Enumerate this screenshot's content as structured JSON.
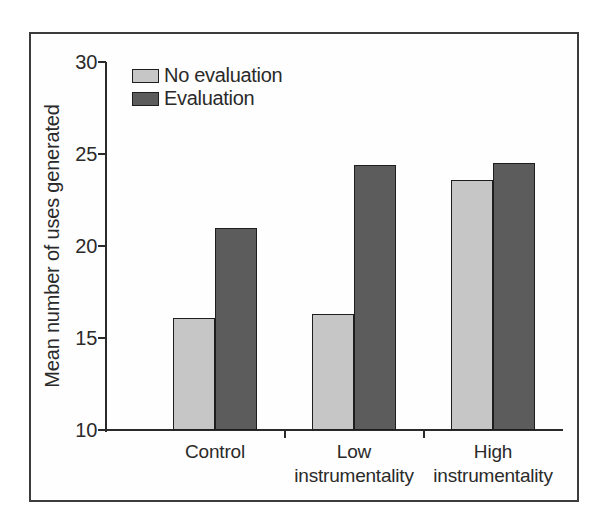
{
  "chart_data": {
    "type": "bar",
    "title": "",
    "ylabel": "Mean number of uses generated",
    "xlabel": "",
    "ylim": [
      10,
      30
    ],
    "yticks": [
      10,
      15,
      20,
      25,
      30
    ],
    "categories": [
      "Control",
      "Low instrumentality",
      "High instrumentality"
    ],
    "series": [
      {
        "name": "No evaluation",
        "color": "#c6c6c6",
        "values": [
          16.1,
          16.3,
          23.6
        ]
      },
      {
        "name": "Evaluation",
        "color": "#5c5c5c",
        "values": [
          21.0,
          24.4,
          24.5
        ]
      }
    ],
    "legend_position": "top-left",
    "grid": false
  },
  "figure": {
    "frame_border_color": "#3c3c3c",
    "background": "#ffffff",
    "axis_color": "#2a2a2a",
    "text_color": "#2a2a2a",
    "bar_outline_color": "#1e1e1e"
  }
}
